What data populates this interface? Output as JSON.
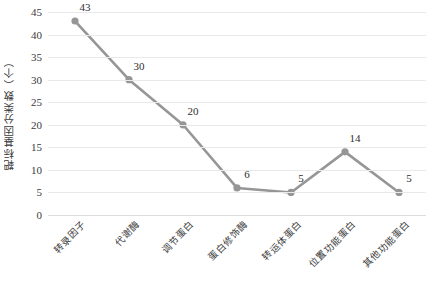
{
  "chart_data": {
    "type": "line",
    "title": "",
    "xlabel": "",
    "ylabel": "靶标基因分类数（个）",
    "categories": [
      "转录因子",
      "代谢酶",
      "调节蛋白",
      "蛋白修饰酶",
      "转运体蛋白",
      "位置功能蛋白",
      "其他功能蛋白"
    ],
    "values": [
      43,
      30,
      20,
      6,
      5,
      14,
      5
    ],
    "point_labels": [
      "43",
      "30",
      "20",
      "6",
      "5",
      "14",
      "5"
    ],
    "ylim": [
      0,
      45
    ],
    "ytick_step": 5,
    "ytick_labels": [
      "0",
      "5",
      "10",
      "15",
      "20",
      "25",
      "30",
      "35",
      "40",
      "45"
    ],
    "grid": true,
    "legend": "none",
    "series_color": "#969696",
    "marker_color": "#969696",
    "gridline_color": "#e9e9e9",
    "background_color": "#ffffff",
    "text_color": "#3a3a3a"
  }
}
